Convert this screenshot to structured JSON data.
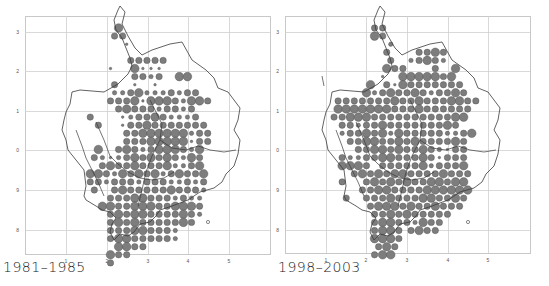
{
  "figure": {
    "panels": [
      {
        "caption": "1981–1985",
        "offset_x": 0,
        "frame": {
          "x": 25,
          "y": 16,
          "w": 245,
          "h": 238
        },
        "x_ticks": [
          {
            "label": "1",
            "x": 66
          },
          {
            "label": "2",
            "x": 107
          },
          {
            "label": "3",
            "x": 148
          },
          {
            "label": "4",
            "x": 188
          },
          {
            "label": "5",
            "x": 229
          }
        ],
        "y_ticks": [
          {
            "label": "3",
            "y": 32
          },
          {
            "label": "2",
            "y": 71
          },
          {
            "label": "1",
            "y": 111
          },
          {
            "label": "0",
            "y": 150
          },
          {
            "label": "9",
            "y": 190
          },
          {
            "label": "8",
            "y": 230
          }
        ],
        "grid_origin": {
          "x": 70,
          "y": 28
        },
        "grid_step": 8.1,
        "dot_rows": [
          "..........0.4.................",
          "...........3.3................",
          "..............1..........",
          "............................",
          "...............3.3.3.3.3........",
          "..........1.....4.1.1.1......",
          "................3.3.2.3....4.4...",
          "...........3....1....1.....",
          "...........2.2.3.4.2.2.2.3.2.3.3..",
          "..........3.3.3.4.1.4.4.4.3.2.4.4.3",
          "............3.4.3.3.3.2.3.3.2.3",
          ".....3.......1.2.3.3.4.3.2.2.2.3",
          ".......3.....1.3.3.4.3.3.3.3.3.3.3",
          "..............3.3.4.4.4.4.4.4.2.3.3",
          "..............3.3.3.4.4.4.4.4.1.3.3",
          ".......4....3.4.3.2.3.4.4.4.3.2.4.",
          "......3.2.1.2.3.4.3.4.3.4.3.2.4.3",
          "........3.4.3.3.4.3.3.3.4.2.2.3.4.",
          ".....4.4.3.2.4.3.4.3.4.2.3.4.3.3.4.",
          ".....3.3.2.3.3.3.2.3.3.3.2.2.3.2.3.",
          "......3....3.4.3.3.3.3.3.4.3.3.3.2.",
          "..........3.3.3.4.4.3.3.3.2.3.2.2..",
          "........4.4.3.3.4.4.4.3.3.4.4.4.3",
          "..........3.4.3.4.4.3.3.3.3.4.3.2",
          "..........3.4.3.4.3.3.3.3.3.4.3.",
          "..........3.3.3.4.4.3.3.3.2.....",
          "..........3.4.4.3.3.3.3.3.2.....",
          "............4.4.3.3............",
          "..........4.3.3................",
          "..........3......................"
        ],
        "outline": "M120,6 L125,12 L122,24 L128,36 L135,48 L142,55 L152,50 L170,44 L182,42 L192,60 L206,70 L214,78 L218,88 L228,92 L234,100 L240,108 L238,120 L234,130 L240,140 L238,154 L234,166 L226,174 L222,182 L214,188 L200,192 L188,200 L172,206 L160,210 L156,216 L150,222 L140,224 L134,232 L128,236 L120,234 L114,240 L110,232 L112,224 L116,218 L110,212 L102,210 L96,206 L86,200 L84,196 L86,186 L84,170 L76,160 L68,150 L66,140 L62,130 L64,120 L66,112 L70,104 L72,92 L80,90 L104,92 L118,84 L128,74 L132,66 L130,58 L126,48 L122,38 L116,30 L114,20 L118,10 Z",
        "inner_lines": [
          "M96,122 L104,140 L110,156 L118,164 L128,172 L140,178 L152,180 L164,178 L174,172",
          "M150,100 L156,112 L162,124 L160,140 L152,156 L146,172 L142,190 L138,206",
          "M160,140 L172,148 L186,150 L198,146 L210,150 L224,152 L236,150",
          "M76,130 L82,146 L86,158 L92,170 L98,182 L104,196"
        ],
        "marker_o": {
          "x": 208,
          "y": 222
        }
      },
      {
        "caption": "1998–2003",
        "offset_x": 275,
        "frame": {
          "x": 10,
          "y": 16,
          "w": 245,
          "h": 237
        },
        "x_ticks": [
          {
            "label": "1",
            "x": 51
          },
          {
            "label": "2",
            "x": 91
          },
          {
            "label": "3",
            "x": 132
          },
          {
            "label": "4",
            "x": 173
          },
          {
            "label": "5",
            "x": 213
          }
        ],
        "y_ticks": [
          {
            "label": "3",
            "y": 32
          },
          {
            "label": "2",
            "y": 71
          },
          {
            "label": "1",
            "y": 111
          },
          {
            "label": "0",
            "y": 150
          },
          {
            "label": "9",
            "y": 190
          },
          {
            "label": "8",
            "y": 230
          }
        ],
        "grid_origin": {
          "x": 55,
          "y": 28
        },
        "grid_step": 8.1,
        "dot_rows": [
          "...........3.3.................",
          "...........4.3..................",
          "...............2.................",
          "..............3.......3.3.4.3...",
          "...............3....2.3.4.3.2...",
          "..............4.3.3.......3....4..",
          ".............1....4.4.4.4.4.3.4...",
          "..........4...3.1.4.3.3.3.3.3.3.3",
          ".........4.2.3.4.3.3.4.3.2.3.3.4.3",
          "..3.3.3.3.3.3.3.4.3.3.4.3.3.3.4.4.3.3",
          "..4.4.4.4.4.4.4.3.3.3.4.3.3.3.3.3.3",
          ".3.3.4.4.4.3.3.3.3.3.3.3.3.3.3.4.4.",
          "...3.3.2.3.3.4.3.3.3.3.3.3.3.4.3..",
          "...2.3.3.4.3.4.2.4.3.3.3.3.3.2.2.3.4",
          ".....3.3.4.4.3.3.4.3.4.3.3.3.3.4.3",
          ".......3.3.4.4.3.4.3.3.4.3.2.1.3.3",
          "...3.2.2.3.3.4.4.3.3.3.4.3.1.3.3.3",
          "...4.4.4.3...3.3.3.3.3.4.2.3.3.3.4",
          "......3.4.3.4.3.4.4.3.3.3.3.4.3.3.3",
          "...3.....3.4.3.4.3.4.3.3.4.4.3.4.4",
          "........3.3.4.4.3.3.3.3.4.4.4.4.4.4",
          "....3....3.3.3.4.3.3.3.4.4.3.3.4.3",
          "..........3.4.4.4.3.4.3.3.4.3.3.3.",
          "...........3.3.4.3.4.3.3.3.3.3.....",
          "...........3.4.4.3.3.2.4.3.3.......",
          "...........3.4.4.3..3.4.3.3........",
          "...........4.4.4.3..............",
          "............3.4.3..............",
          "...........3.4.4...............",
          "..............................."
        ],
        "outline": "M105,6 L110,12 L107,24 L113,36 L120,48 L127,55 L137,50 L155,44 L167,42 L177,60 L191,70 L199,78 L203,88 L213,92 L219,100 L225,108 L223,120 L219,130 L225,140 L223,154 L219,166 L211,174 L207,182 L199,188 L185,192 L173,200 L157,206 L145,210 L141,216 L135,222 L125,224 L119,232 L113,236 L105,234 L99,240 L95,232 L97,224 L101,218 L95,212 L87,210 L81,206 L71,200 L69,196 L71,186 L69,170 L61,160 L53,150 L51,140 L47,130 L49,120 L51,112 L55,104 L57,92 L65,90 L89,92 L103,84 L113,74 L117,66 L115,58 L111,48 L107,38 L101,30 L99,20 L103,10 Z",
        "inner_lines": [
          "M81,122 L89,140 L95,156 L103,164 L113,172 L125,178 L137,180 L149,178 L159,172",
          "M135,100 L141,112 L147,124 L145,140 L137,156 L131,172 L127,190 L123,206",
          "M145,140 L157,148 L171,150 L183,146 L195,150 L209,152 L221,150",
          "M61,130 L67,146 L71,158 L77,170 L83,182 L89,196",
          "M47,76 L49,86"
        ],
        "marker_o": {
          "x": 193,
          "y": 222
        }
      }
    ],
    "colors": {
      "dot_fill": "#7d7d7d",
      "dot_stroke": "#4d4d4d",
      "grid": "#cfcfcf",
      "frame": "#c8c8c8",
      "outline": "#3a3a3a",
      "tick_label": "#555555"
    },
    "dot_radii": {
      "1": 1.3,
      "2": 2.2,
      "3": 3.2,
      "4": 4.3
    }
  }
}
